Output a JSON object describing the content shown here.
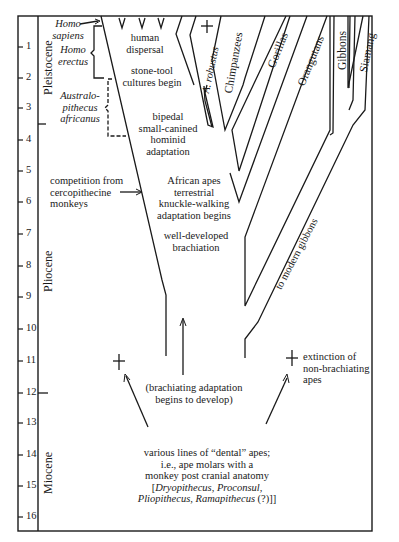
{
  "time_axis": {
    "unit": "million years ago",
    "ticks": [
      "1",
      "2",
      "3",
      "4",
      "5",
      "6",
      "7",
      "8",
      "9",
      "10",
      "11",
      "12",
      "13",
      "14",
      "15",
      "16"
    ],
    "epochs": [
      {
        "name": "Pleistocene"
      },
      {
        "name": "Pliocene"
      },
      {
        "name": "Miocene"
      }
    ]
  },
  "hominid_stages": [
    {
      "label": "Homo sapiens",
      "line1": "Homo",
      "line2": "sapiens"
    },
    {
      "label": "Homo erectus",
      "line1": "Homo",
      "line2": "erectus"
    },
    {
      "label": "Australopithecus africanus",
      "line1": "Australo-",
      "line2": "pithecus",
      "line3": "africanus"
    }
  ],
  "lineages": [
    {
      "name": "A. robustus",
      "extinct": true
    },
    {
      "name": "Chimpanzees"
    },
    {
      "name": "Gorillas"
    },
    {
      "name": "Orangutans"
    },
    {
      "name": "Gibbons"
    },
    {
      "name": "Siamang"
    },
    {
      "name": "to modern gibbons"
    }
  ],
  "annotations": {
    "human_dispersal": {
      "line1": "human",
      "line2": "dispersal"
    },
    "stone_tool": {
      "line1": "stone-tool",
      "line2": "cultures begin"
    },
    "bipedal": {
      "line1": "bipedal",
      "line2": "small-canined",
      "line3": "hominid",
      "line4": "adaptation"
    },
    "competition": {
      "line1": "competition from",
      "line2": "cercopithecine",
      "line3": "monkeys"
    },
    "knuckle": {
      "line1": "African apes",
      "line2": "terrestrial",
      "line3": "knuckle-walking",
      "line4": "adaptation begins"
    },
    "brachiation": {
      "line1": "well-developed",
      "line2": "brachiation"
    },
    "brachiating_begins": {
      "line1": "(brachiating adaptation",
      "line2": "begins to develop)"
    },
    "extinction": {
      "line1": "extinction of",
      "line2": "non-brachiating",
      "line3": "apes"
    },
    "dental_apes": {
      "line1": "various lines of “dental” apes;",
      "line2": "i.e., ape molars with a",
      "line3": "monkey post cranial anatomy",
      "line4_pre": "[",
      "line4": "Dryopithecus, Proconsul,",
      "line5": "Pliopithecus, Ramapithecus",
      "line5_post": " (?)]"
    }
  },
  "symbols": {
    "extinction_cross": "+",
    "arrow": "→"
  }
}
